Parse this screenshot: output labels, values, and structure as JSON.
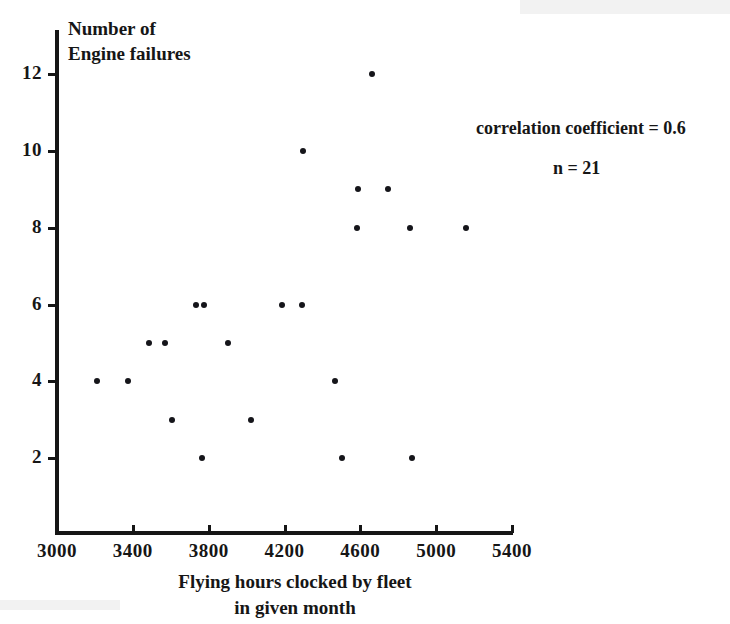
{
  "chart_data": {
    "type": "scatter",
    "title": "",
    "xlabel": "Flying hours clocked by fleet\nin given month",
    "ylabel": "Number of\nEngine failures",
    "xlim": [
      3000,
      5400
    ],
    "ylim": [
      0,
      13
    ],
    "grid": false,
    "legend": "none",
    "xticks": [
      3000,
      3400,
      3800,
      4200,
      4600,
      5000,
      5400
    ],
    "xtick_labels": [
      "3000",
      "3400",
      "3800",
      "4200",
      "4600",
      "5000",
      "5400"
    ],
    "yticks": [
      2,
      4,
      6,
      8,
      10,
      12
    ],
    "ytick_labels": [
      "2",
      "4",
      "6",
      "8",
      "10",
      "12"
    ],
    "points": [
      {
        "x": 3210,
        "y": 4
      },
      {
        "x": 3375,
        "y": 4
      },
      {
        "x": 3485,
        "y": 5
      },
      {
        "x": 3570,
        "y": 5
      },
      {
        "x": 3605,
        "y": 3
      },
      {
        "x": 3735,
        "y": 6
      },
      {
        "x": 3775,
        "y": 6
      },
      {
        "x": 3765,
        "y": 2
      },
      {
        "x": 3900,
        "y": 5
      },
      {
        "x": 4025,
        "y": 3
      },
      {
        "x": 4185,
        "y": 6
      },
      {
        "x": 4290,
        "y": 6
      },
      {
        "x": 4300,
        "y": 10
      },
      {
        "x": 4465,
        "y": 4
      },
      {
        "x": 4505,
        "y": 2
      },
      {
        "x": 4585,
        "y": 8
      },
      {
        "x": 4590,
        "y": 9
      },
      {
        "x": 4660,
        "y": 12
      },
      {
        "x": 4745,
        "y": 9
      },
      {
        "x": 4860,
        "y": 8
      },
      {
        "x": 4870,
        "y": 2
      },
      {
        "x": 5155,
        "y": 8
      }
    ],
    "annotations": [
      {
        "name": "correlation-coefficient",
        "text": "correlation coefficient = 0.6"
      },
      {
        "name": "sample-size",
        "text": "n = 21"
      }
    ],
    "marker_color": "#15151a"
  }
}
